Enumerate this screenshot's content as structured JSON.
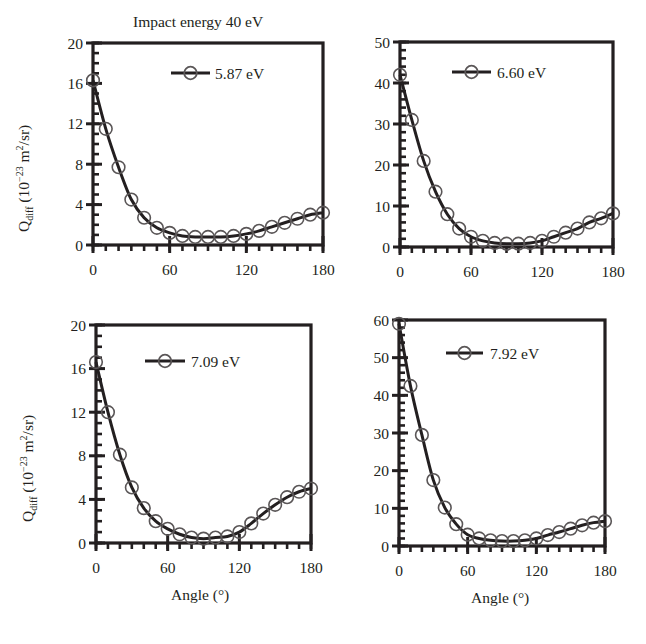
{
  "figure": {
    "title": "Impact energy 40 eV",
    "ylabel": {
      "symbol": "Q",
      "subscript": "diff",
      "unit_prefix": "(10",
      "exponent": "−23",
      "unit_mid": " m",
      "unit_sq": "2",
      "unit_suffix": "/sr)"
    },
    "xlabel": "Angle (°)",
    "colors": {
      "ink": "#231f20",
      "marker_stroke": "#5a5657",
      "background": "#ffffff"
    }
  },
  "chart_data": [
    {
      "type": "line",
      "title": "Impact energy 40 eV",
      "xlabel": "",
      "ylabel": "Q_diff (10^-23 m^2/sr)",
      "legend": "5.87 eV",
      "legend_position": "upper right inside",
      "grid": false,
      "xlim": [
        0,
        180
      ],
      "ylim": [
        0,
        20
      ],
      "xticks": [
        0,
        60,
        120,
        180
      ],
      "yticks": [
        0,
        4,
        8,
        12,
        16,
        20
      ],
      "x": [
        0,
        10,
        20,
        30,
        40,
        50,
        60,
        70,
        80,
        90,
        100,
        110,
        120,
        130,
        140,
        150,
        160,
        170,
        180
      ],
      "series": [
        {
          "name": "5.87 eV",
          "values": [
            16.3,
            11.5,
            7.7,
            4.5,
            2.7,
            1.7,
            1.2,
            0.9,
            0.8,
            0.8,
            0.8,
            0.9,
            1.1,
            1.4,
            1.8,
            2.2,
            2.6,
            3.0,
            3.2
          ]
        }
      ]
    },
    {
      "type": "line",
      "title": "",
      "xlabel": "",
      "ylabel": "",
      "legend": "6.60 eV",
      "legend_position": "upper right inside",
      "grid": false,
      "xlim": [
        0,
        180
      ],
      "ylim": [
        0,
        50
      ],
      "xticks": [
        0,
        60,
        120,
        180
      ],
      "yticks": [
        0,
        10,
        20,
        30,
        40,
        50
      ],
      "x": [
        0,
        10,
        20,
        30,
        40,
        50,
        60,
        70,
        80,
        90,
        100,
        110,
        120,
        130,
        140,
        150,
        160,
        170,
        180
      ],
      "series": [
        {
          "name": "6.60 eV",
          "values": [
            42,
            31,
            21,
            13.5,
            8,
            4.5,
            2.5,
            1.5,
            1.0,
            0.8,
            0.8,
            1.0,
            1.5,
            2.5,
            3.5,
            4.5,
            6.0,
            7.0,
            8.2
          ]
        }
      ]
    },
    {
      "type": "line",
      "title": "",
      "xlabel": "Angle (°)",
      "ylabel": "Q_diff (10^-23 m^2/sr)",
      "legend": "7.09 eV",
      "legend_position": "upper right inside",
      "grid": false,
      "xlim": [
        0,
        180
      ],
      "ylim": [
        0,
        20
      ],
      "xticks": [
        0,
        60,
        120,
        180
      ],
      "yticks": [
        0,
        4,
        8,
        12,
        16,
        20
      ],
      "x": [
        0,
        10,
        20,
        30,
        40,
        50,
        60,
        70,
        80,
        90,
        100,
        110,
        120,
        130,
        140,
        150,
        160,
        170,
        180
      ],
      "series": [
        {
          "name": "7.09 eV",
          "values": [
            16.6,
            12.0,
            8.1,
            5.1,
            3.2,
            2.0,
            1.3,
            0.8,
            0.5,
            0.4,
            0.5,
            0.6,
            1.0,
            1.8,
            2.7,
            3.5,
            4.2,
            4.7,
            5.0
          ]
        }
      ]
    },
    {
      "type": "line",
      "title": "",
      "xlabel": "Angle (°)",
      "ylabel": "",
      "legend": "7.92 eV",
      "legend_position": "upper right inside",
      "grid": false,
      "xlim": [
        0,
        180
      ],
      "ylim": [
        0,
        60
      ],
      "xticks": [
        0,
        60,
        120,
        180
      ],
      "yticks": [
        0,
        10,
        20,
        30,
        40,
        50,
        60
      ],
      "x": [
        0,
        10,
        20,
        30,
        40,
        50,
        60,
        70,
        80,
        90,
        100,
        110,
        120,
        130,
        140,
        150,
        160,
        170,
        180
      ],
      "series": [
        {
          "name": "7.92 eV",
          "values": [
            59,
            42.5,
            29.5,
            17.5,
            10.2,
            5.8,
            3.0,
            2.0,
            1.5,
            1.3,
            1.3,
            1.5,
            2.0,
            2.9,
            3.7,
            4.6,
            5.5,
            6.2,
            6.6
          ]
        }
      ]
    }
  ],
  "layout": {
    "panels": [
      {
        "left": 93,
        "right": 323,
        "top": 43,
        "bottom": 245,
        "legend": {
          "x1": 171,
          "x2": 210,
          "y": 73,
          "tx": 215
        },
        "yminor": 1
      },
      {
        "left": 400,
        "right": 613,
        "top": 42,
        "bottom": 247,
        "legend": {
          "x1": 452,
          "x2": 491,
          "y": 72,
          "tx": 497
        },
        "yminor": 2
      },
      {
        "left": 96,
        "right": 311,
        "top": 325,
        "bottom": 543,
        "legend": {
          "x1": 145,
          "x2": 185,
          "y": 361,
          "tx": 191
        },
        "yminor": 1
      },
      {
        "left": 399,
        "right": 605,
        "top": 320,
        "bottom": 546,
        "legend": {
          "x1": 446,
          "x2": 483,
          "y": 353,
          "tx": 490
        },
        "yminor": 2
      }
    ]
  }
}
